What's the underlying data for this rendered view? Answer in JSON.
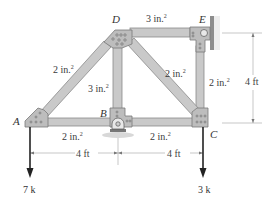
{
  "figure": {
    "type": "truss",
    "colors": {
      "member_fill": "#c9c9c9",
      "member_edge": "#8a8a8a",
      "gusset_fill": "#bdbdbd",
      "load_arrow": "#222222",
      "dimension_line": "#aaaaaa",
      "ground": "#9a9a9a"
    },
    "nodes": {
      "A": {
        "label": "A"
      },
      "B": {
        "label": "B"
      },
      "C": {
        "label": "C"
      },
      "D": {
        "label": "D"
      },
      "E": {
        "label": "E"
      }
    },
    "members": {
      "AD": {
        "area": "2 in.",
        "exp": "2"
      },
      "DE": {
        "area": "3 in.",
        "exp": "2"
      },
      "BD": {
        "area": "3 in.",
        "exp": "2"
      },
      "DC": {
        "area": "2 in.",
        "exp": "2"
      },
      "EC": {
        "area": "2 in.",
        "exp": "2"
      },
      "AB": {
        "area": "2 in.",
        "exp": "2"
      },
      "BC": {
        "area": "2 in.",
        "exp": "2"
      }
    },
    "dimensions": {
      "AB_span": "4 ft",
      "BC_span": "4 ft",
      "height": "4 ft"
    },
    "loads": {
      "A": "7 k",
      "C": "3 k"
    },
    "supports": {
      "E": "pin-wall",
      "B": "pin-ground"
    }
  }
}
